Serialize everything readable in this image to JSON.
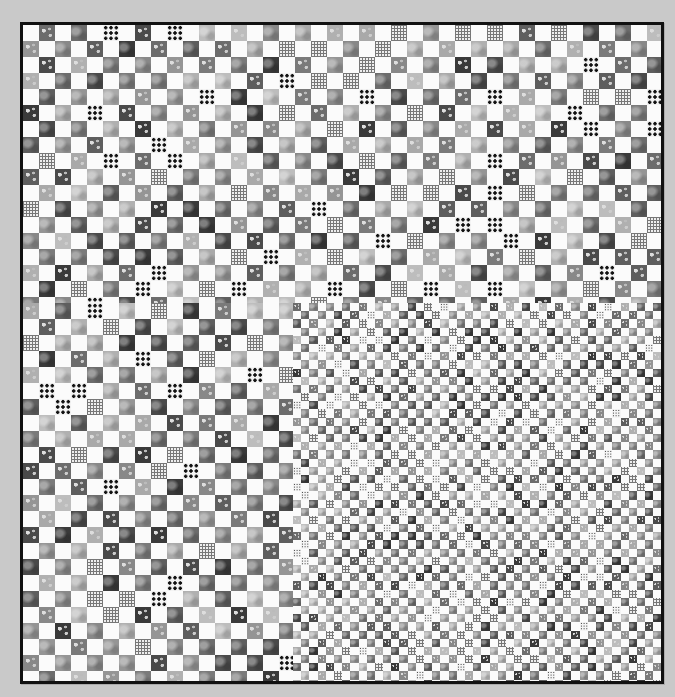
{
  "scene": {
    "subject": "checkerboard patchwork quilt",
    "background_color": "#c9c9c9",
    "border_color": "#111111",
    "quilt_bg": "#fdfdfd"
  },
  "palette": {
    "grays": [
      "#4a4a4a",
      "#5e5e5e",
      "#7a7a7a",
      "#959595",
      "#a9a9a9",
      "#bdbdbd",
      "#3a3a3a",
      "#888888",
      "#b0b0b0",
      "#6c6c6c"
    ],
    "white": "#fbfbfb"
  },
  "sections": [
    {
      "name": "large-top",
      "left": 0,
      "top": 0,
      "width": 638,
      "height": 278,
      "cell": 16,
      "seed": 7
    },
    {
      "name": "large-left",
      "left": 0,
      "top": 278,
      "width": 270,
      "height": 378,
      "cell": 16,
      "seed": 13
    },
    {
      "name": "small-bottom-right",
      "left": 270,
      "top": 278,
      "width": 368,
      "height": 378,
      "cell": 8.2,
      "seed": 29
    }
  ],
  "fabric_mix": {
    "dots": 0.08,
    "check": 0.1,
    "floral": 0.3,
    "mottle": 0.52
  }
}
